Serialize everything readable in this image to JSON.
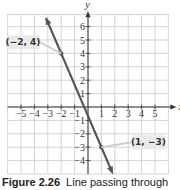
{
  "chart_data": {
    "type": "line",
    "title": "",
    "xlabel": "x",
    "ylabel": "y",
    "xlim": [
      -6,
      6
    ],
    "ylim": [
      -5,
      7
    ],
    "x_ticks": [
      -5,
      -4,
      -3,
      -2,
      -1,
      1,
      2,
      3,
      4,
      5
    ],
    "y_ticks": [
      -4,
      -3,
      -2,
      -1,
      1,
      2,
      3,
      4,
      5,
      6
    ],
    "x_tick_labels": [
      "−5",
      "−4",
      "−3",
      "−2",
      "−1",
      "1",
      "2",
      "3",
      "4",
      "5"
    ],
    "y_tick_labels": [
      "−4",
      "−3",
      "−2",
      "−1",
      "1",
      "2",
      "3",
      "4",
      "5",
      "6"
    ],
    "grid": true,
    "series": [
      {
        "name": "line",
        "points": [
          [
            -2,
            4
          ],
          [
            1,
            -3
          ]
        ],
        "slope": -2.3333,
        "intercept": -0.6667,
        "extends_with_arrows": true
      }
    ],
    "annotations": [
      {
        "label": "(−2, 4)",
        "x": -2,
        "y": 4,
        "placement": "left"
      },
      {
        "label": "(1, −3)",
        "x": 1,
        "y": -3,
        "placement": "right"
      }
    ]
  },
  "caption": {
    "figure_label": "Figure 2.26",
    "text": "Line passing through"
  }
}
